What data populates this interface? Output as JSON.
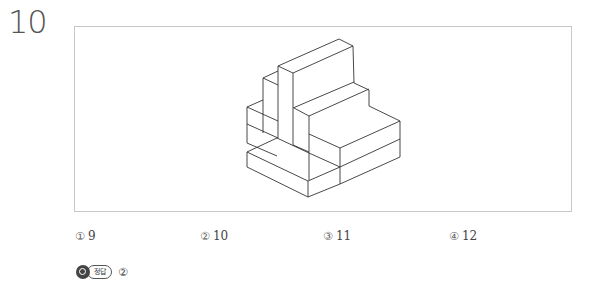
{
  "question": {
    "number": "10",
    "figure": {
      "description": "isometric line drawing of stacked rectangular blocks",
      "stroke_color": "#333333"
    },
    "options": [
      {
        "mark": "①",
        "value": "9"
      },
      {
        "mark": "②",
        "value": "10"
      },
      {
        "mark": "③",
        "value": "11"
      },
      {
        "mark": "④",
        "value": "12"
      }
    ],
    "answer": {
      "icon": "magnifier-icon",
      "label": "정답",
      "value": "②"
    }
  }
}
